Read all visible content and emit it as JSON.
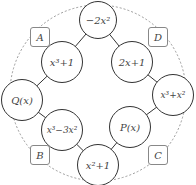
{
  "diagram": {
    "nodes": [
      {
        "id": "top",
        "label": "−2x²"
      },
      {
        "id": "upper-left",
        "label": "x³+1"
      },
      {
        "id": "upper-right",
        "label": "2x+1"
      },
      {
        "id": "left",
        "label": "Q(x)"
      },
      {
        "id": "right",
        "label": "x³+x²"
      },
      {
        "id": "lower-left",
        "label": "x³−3x²"
      },
      {
        "id": "lower-right",
        "label": "P(x)"
      },
      {
        "id": "bottom",
        "label": "x²+1"
      }
    ],
    "boxes": [
      {
        "id": "A",
        "label": "A"
      },
      {
        "id": "D",
        "label": "D"
      },
      {
        "id": "B",
        "label": "B"
      },
      {
        "id": "C",
        "label": "C"
      }
    ]
  }
}
